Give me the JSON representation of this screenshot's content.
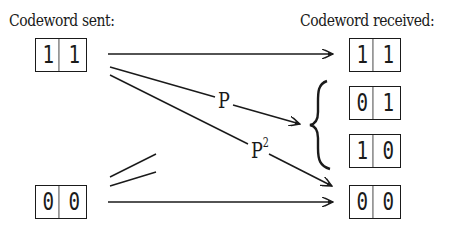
{
  "labels": {
    "sent": "Codeword sent:",
    "received": "Codeword received:"
  },
  "sent_codewords": [
    {
      "bits": [
        "1",
        "1"
      ]
    },
    {
      "bits": [
        "0",
        "0"
      ]
    }
  ],
  "received_codewords": [
    {
      "bits": [
        "1",
        "1"
      ]
    },
    {
      "bits": [
        "0",
        "1"
      ]
    },
    {
      "bits": [
        "1",
        "0"
      ]
    },
    {
      "bits": [
        "0",
        "0"
      ]
    }
  ],
  "edges": {
    "p_label": "P",
    "p2_label": "P",
    "p2_exponent": "2"
  },
  "colors": {
    "ink": "#1a1a1a",
    "background": "#ffffff"
  }
}
